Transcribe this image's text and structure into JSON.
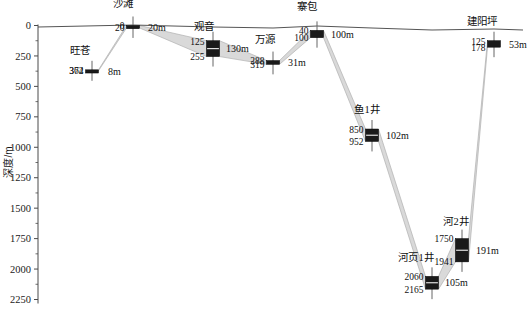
{
  "chart_data": {
    "type": "bar",
    "title": "",
    "xlabel": "",
    "ylabel": "深度/m",
    "ylim": [
      0,
      2320
    ],
    "yticks": [
      0,
      250,
      500,
      750,
      1000,
      1250,
      1500,
      1750,
      2000,
      2250
    ],
    "ytick_labels": [
      "0",
      "250",
      "500",
      "750",
      "1000",
      "1250",
      "1500",
      "1750",
      "2000",
      "2250"
    ],
    "y_inverted": true,
    "grid": false,
    "legend": "none",
    "series": [
      {
        "name": "wells",
        "categories": [
          "旺苍",
          "沙滩",
          "观音",
          "万源",
          "寨包",
          "鱼1井",
          "河页1井",
          "河2井",
          "建阳坪"
        ],
        "top_depths": [
          364,
          0,
          125,
          288,
          40,
          850,
          2060,
          1750,
          125
        ],
        "bottom_depths": [
          372,
          20,
          255,
          319,
          100,
          952,
          2165,
          1941,
          178
        ],
        "thickness_labels": [
          "8m",
          "20m",
          "130m",
          "31m",
          "100m",
          "102m",
          "105m",
          "191m",
          "53m"
        ]
      }
    ],
    "wells": [
      {
        "name": "旺苍",
        "x": 92,
        "top": 364,
        "bottom": 372,
        "top_label": "364",
        "bottom_label": "372",
        "thickness": "8m",
        "name_dx": -12,
        "name_dy": -16,
        "thick_dx": 16
      },
      {
        "name": "沙滩",
        "x": 133,
        "top": 0,
        "bottom": 20,
        "top_label": "0",
        "bottom_label": "20",
        "thickness": "20m",
        "name_dx": -10,
        "name_dy": -19,
        "thick_dx": 15
      },
      {
        "name": "观音",
        "x": 213,
        "top": 125,
        "bottom": 255,
        "top_label": "125",
        "bottom_label": "255",
        "thickness": "130m",
        "name_dx": -9,
        "name_dy": -11,
        "thick_dx": 13
      },
      {
        "name": "万源",
        "x": 273,
        "top": 288,
        "bottom": 319,
        "top_label": "288",
        "bottom_label": "319",
        "thickness": "31m",
        "name_dx": -8,
        "name_dy": -18,
        "thick_dx": 15
      },
      {
        "name": "寨包",
        "x": 317,
        "top": 40,
        "bottom": 100,
        "top_label": "40",
        "bottom_label": "100",
        "thickness": "100m",
        "name_dx": -10,
        "name_dy": -20,
        "thick_dx": 14
      },
      {
        "name": "鱼1井",
        "x": 372,
        "top": 850,
        "bottom": 952,
        "top_label": "850",
        "bottom_label": "952",
        "thickness": "102m",
        "name_dx": -5,
        "name_dy": -16,
        "thick_dx": 14
      },
      {
        "name": "河页1井",
        "x": 432,
        "top": 2060,
        "bottom": 2165,
        "top_label": "2060",
        "bottom_label": "2165",
        "thickness": "105m",
        "name_dx": -16,
        "name_dy": -15,
        "thick_dx": 13
      },
      {
        "name": "河2井",
        "x": 462,
        "top": 1750,
        "bottom": 1941,
        "top_label": "1750",
        "bottom_label": "1941",
        "thickness": "191m",
        "name_dx": -6,
        "name_dy": -14,
        "thick_dx": 14
      },
      {
        "name": "建阳坪",
        "x": 494,
        "top": 125,
        "bottom": 178,
        "top_label": "125",
        "bottom_label": "178",
        "thickness": "53m",
        "name_dx": -12,
        "name_dy": -16,
        "thick_dx": 15
      }
    ],
    "correlation_bands": [
      {
        "from": "旺苍",
        "to": "沙滩"
      },
      {
        "from": "沙滩",
        "to": "观音"
      },
      {
        "from": "观音",
        "to": "万源"
      },
      {
        "from": "万源",
        "to": "寨包"
      },
      {
        "from": "寨包",
        "to": "鱼1井"
      },
      {
        "from": "鱼1井",
        "to": "河页1井"
      },
      {
        "from": "河页1井",
        "to": "河2井"
      },
      {
        "from": "河2井",
        "to": "建阳坪"
      }
    ],
    "surface_line": {
      "label": "topographic-surface",
      "points": [
        [
          38,
          27
        ],
        [
          133,
          25
        ],
        [
          213,
          27
        ],
        [
          273,
          28
        ],
        [
          317,
          26
        ],
        [
          372,
          28
        ],
        [
          432,
          30
        ],
        [
          494,
          29
        ],
        [
          523,
          30
        ]
      ]
    },
    "colors": {
      "interval_fill": "#1a1a1a",
      "band_fill": "#d9d9d9",
      "band_stroke": "#b0b0b0",
      "axis": "#4a4a4a",
      "text": "#101010",
      "background": "#ffffff"
    }
  }
}
